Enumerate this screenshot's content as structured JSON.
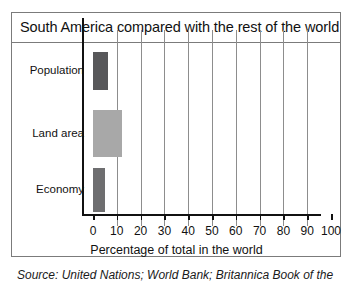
{
  "figure": {
    "title": "South America compared with the rest of the world",
    "source_note": "Source: United Nations; World Bank; Britannica Book of the"
  },
  "chart_data": {
    "type": "bar",
    "orientation": "horizontal",
    "title": "South America compared with the rest of the world",
    "categories": [
      "Population",
      "Land area",
      "Economy"
    ],
    "values": [
      6.5,
      12,
      5
    ],
    "series": [
      {
        "name": "Percentage of total in the world",
        "values": [
          6.5,
          12,
          5
        ]
      }
    ],
    "bar_colors": [
      "#58585a",
      "#a8a8a8",
      "#6e6e70"
    ],
    "xlabel": "Percentage of total in the world",
    "ylabel": "",
    "xlim": [
      0,
      100
    ],
    "xticks": [
      0,
      10,
      20,
      30,
      40,
      50,
      60,
      70,
      80,
      90,
      100
    ],
    "xtick_labels": [
      "0",
      "10",
      "20",
      "30",
      "40",
      "50",
      "60",
      "70",
      "80",
      "90",
      "100"
    ],
    "grid": "vertical",
    "legend": "none"
  }
}
